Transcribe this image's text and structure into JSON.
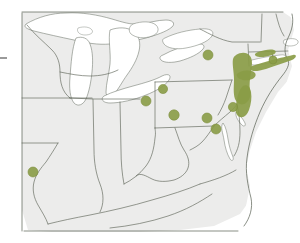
{
  "figure": {
    "kind": "distribution-map",
    "title": "",
    "caption": "",
    "region_label": "Northeastern and Midwestern United States",
    "background_color": "#ffffff",
    "land_color": "#ececeb",
    "water_color": "#ffffff",
    "border_color": "#585f52",
    "coast_color": "#6d7469",
    "marker_color": "#8a9c46",
    "marker_edge_color": "#7d8e3e",
    "range_color": "#8a9c46",
    "range_opacity": 0.92
  },
  "legend": {
    "visible": false,
    "entries": [
      {
        "symbol": "filled-circle",
        "label": "occurrence record",
        "color": "#8a9c46"
      },
      {
        "symbol": "filled-area",
        "label": "shaded range",
        "color": "#8a9c46"
      }
    ]
  },
  "markers": [
    {
      "name": "marker-ontario-lakeplain",
      "x": 208,
      "y": 55,
      "r": 5.0
    },
    {
      "name": "marker-northeast-ohio",
      "x": 163,
      "y": 89,
      "r": 4.6
    },
    {
      "name": "marker-cleveland",
      "x": 146,
      "y": 101,
      "r": 5.0
    },
    {
      "name": "marker-central-penn",
      "x": 174,
      "y": 115,
      "r": 5.2
    },
    {
      "name": "marker-south-penn",
      "x": 207,
      "y": 118,
      "r": 5.0
    },
    {
      "name": "marker-chesapeake-head",
      "x": 216,
      "y": 129,
      "r": 5.0
    },
    {
      "name": "marker-delaware-valley",
      "x": 233,
      "y": 107,
      "r": 4.6
    },
    {
      "name": "marker-southwest-illinois",
      "x": 33,
      "y": 172,
      "r": 5.0
    },
    {
      "name": "marker-long-island-east",
      "x": 273,
      "y": 60,
      "r": 4.0
    }
  ],
  "ranges": [
    {
      "name": "range-hudson-valley",
      "label": "Hudson Valley / eastern New York"
    },
    {
      "name": "range-new-jersey",
      "label": "New Jersey corridor"
    },
    {
      "name": "range-long-island",
      "label": "Long Island / southern Connecticut"
    }
  ],
  "axes": {
    "visible": false
  },
  "notes": []
}
